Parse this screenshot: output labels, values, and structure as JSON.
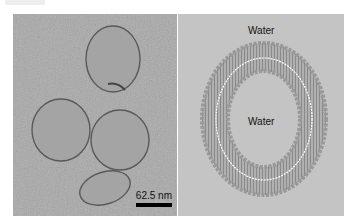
{
  "figure": {
    "left_panel": {
      "type": "TEM micrograph of vesicles",
      "scale_bar_label": "62.5 nm"
    },
    "right_panel": {
      "type": "lipid bilayer vesicle schematic",
      "outer_label": "Water",
      "inner_label": "Water"
    }
  },
  "colors": {
    "tem_background": "#a9a9a9",
    "diagram_background": "#c4c4c4",
    "lipid_head": "#9a9a9a",
    "bilayer_center": "#ffffff"
  }
}
